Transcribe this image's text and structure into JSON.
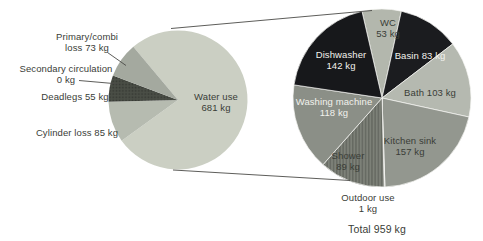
{
  "colors": {
    "background": "#ffffff",
    "text_dark": "#3a3d37",
    "text_light": "#f2f2ed",
    "line": "#4b4b47"
  },
  "chart_data": [
    {
      "type": "pie",
      "name": "water-heating-balance",
      "units": "kg",
      "start_angle_deg": -40,
      "clockwise": true,
      "slices": [
        {
          "label": "Water use",
          "value": 681,
          "lines": [
            "Water use",
            "681 kg"
          ],
          "color": "#cbcfc3",
          "pattern": null
        },
        {
          "label": "Cylinder loss",
          "value": 85,
          "lines": [
            "Cylinder loss 85 kg"
          ],
          "color": "#b6bbb0",
          "pattern": null
        },
        {
          "label": "Deadlegs",
          "value": 55,
          "lines": [
            "Deadlegs 55 kg"
          ],
          "color": "#4a4e46",
          "pattern": "dots"
        },
        {
          "label": "Secondary circulation",
          "value": 0,
          "lines": [
            "Secondary circulation",
            "0 kg"
          ],
          "color": "#9aa096",
          "pattern": null
        },
        {
          "label": "Primary/combi loss",
          "value": 73,
          "lines": [
            "Primary/combi",
            "loss 73 kg"
          ],
          "color": "#a4a99f",
          "pattern": null
        }
      ]
    },
    {
      "type": "pie",
      "name": "water-use-breakdown",
      "units": "kg",
      "start_angle_deg": -13,
      "clockwise": true,
      "total_label": "Total 959 kg",
      "slices": [
        {
          "label": "WC",
          "value": 53,
          "lines": [
            "WC",
            "53 kg"
          ],
          "color": "#b3b7ad",
          "pattern": null
        },
        {
          "label": "Basin",
          "value": 83,
          "lines": [
            "Basin 83 kg"
          ],
          "color": "#1b1c1f",
          "pattern": null
        },
        {
          "label": "Bath",
          "value": 103,
          "lines": [
            "Bath 103 kg"
          ],
          "color": "#b5b9b0",
          "pattern": null
        },
        {
          "label": "Kitchen sink",
          "value": 157,
          "lines": [
            "Kitchen sink",
            "157 kg"
          ],
          "color": "#93978f",
          "pattern": null
        },
        {
          "label": "Outdoor use",
          "value": 1,
          "lines": [
            "Outdoor use",
            "1 kg"
          ],
          "color": "#c4c7bf",
          "pattern": null
        },
        {
          "label": "Shower",
          "value": 89,
          "lines": [
            "Shower",
            "89 kg"
          ],
          "color": "#7d8178",
          "pattern": "vlines"
        },
        {
          "label": "Washing machine",
          "value": 118,
          "lines": [
            "Washing machine",
            "118 kg"
          ],
          "color": "#8b8f87",
          "pattern": null
        },
        {
          "label": "Dishwasher",
          "value": 142,
          "lines": [
            "Dishwasher",
            "142 kg"
          ],
          "color": "#17181b",
          "pattern": null
        }
      ]
    }
  ]
}
